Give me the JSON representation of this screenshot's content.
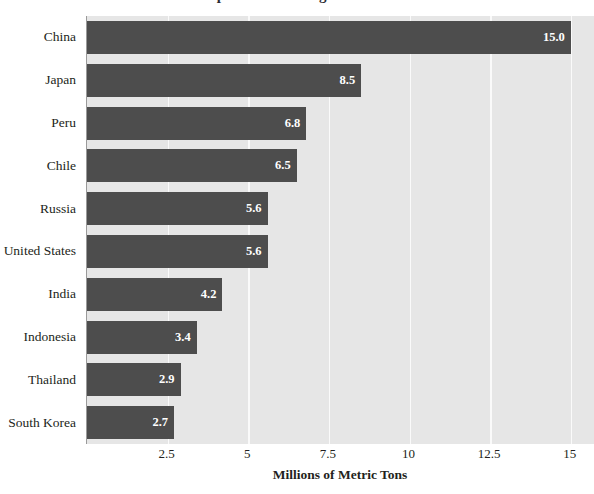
{
  "title_remnant": "Top Fish Producing Countries",
  "chart_data": {
    "type": "bar",
    "orientation": "horizontal",
    "title": "",
    "xlabel": "Millions of Metric Tons",
    "ylabel": "",
    "categories": [
      "China",
      "Japan",
      "Peru",
      "Chile",
      "Russia",
      "United States",
      "India",
      "Indonesia",
      "Thailand",
      "South Korea"
    ],
    "values": [
      15.0,
      8.5,
      6.8,
      6.5,
      5.6,
      5.6,
      4.2,
      3.4,
      2.9,
      2.7
    ],
    "data_labels": [
      "15.0",
      "8.5",
      "6.8",
      "6.5",
      "5.6",
      "5.6",
      "4.2",
      "3.4",
      "2.9",
      "2.7"
    ],
    "xlim": [
      0,
      15.75
    ],
    "xticks": [
      2.5,
      5,
      7.5,
      10,
      12.5,
      15
    ],
    "xtick_labels": [
      "2.5",
      "5",
      "7.5",
      "10",
      "12.5",
      "15"
    ],
    "grid": "vertical-only",
    "legend": "none",
    "colors": {
      "bar": "#4d4d4d",
      "plot_background": "#e6e6e6",
      "gridline": "#fafafa",
      "axis_line": "#9a9a9a",
      "text": "#231f20",
      "data_label_text": "#ffffff",
      "page_background": "#ffffff"
    }
  }
}
